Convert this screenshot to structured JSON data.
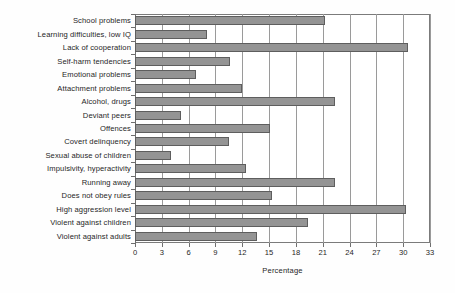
{
  "chart_data": {
    "type": "bar",
    "orientation": "horizontal",
    "title": "",
    "xlabel": "Percentage",
    "ylabel": "",
    "xlim": [
      0,
      33
    ],
    "xticks": [
      0,
      3,
      6,
      9,
      12,
      15,
      18,
      21,
      24,
      27,
      30,
      33
    ],
    "grid": true,
    "legend": false,
    "bar_color": "#949494",
    "bar_edge_color": "#5e5e5e",
    "categories": [
      "School problems",
      "Learning difficulties, low IQ",
      "Lack of cooperation",
      "Self-harm tendencies",
      "Emotional problems",
      "Attachment problems",
      "Alcohol, drugs",
      "Deviant peers",
      "Offences",
      "Covert delinquency",
      "Sexual abuse of children",
      "Impulsivity, hyperactivity",
      "Running away",
      "Does not obey rules",
      "High aggression level",
      "Violent against children",
      "Violent against adults"
    ],
    "values": [
      21.3,
      8.1,
      30.5,
      10.6,
      6.8,
      12.0,
      22.4,
      5.1,
      15.1,
      10.5,
      4.0,
      12.4,
      22.4,
      15.3,
      30.3,
      19.4,
      13.6
    ]
  }
}
